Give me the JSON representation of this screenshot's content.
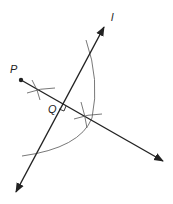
{
  "diagram": {
    "labels": {
      "point_p": "P",
      "point_q": "Q",
      "line_l": "l"
    },
    "colors": {
      "line": "#222222",
      "arc": "#555555",
      "background": "#ffffff"
    }
  }
}
